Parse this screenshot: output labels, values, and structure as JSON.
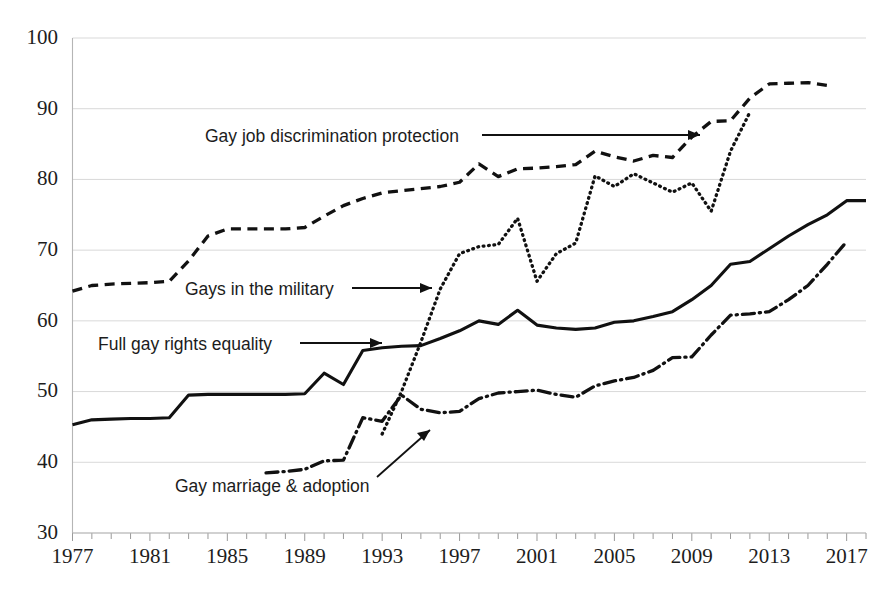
{
  "chart_data": {
    "type": "line",
    "title": "",
    "subtitle": "",
    "xlabel": "",
    "ylabel": "",
    "xlim": [
      1977,
      2018
    ],
    "ylim": [
      30,
      100
    ],
    "yticks": [
      30,
      40,
      50,
      60,
      70,
      80,
      90,
      100
    ],
    "xticks": [
      1977,
      1981,
      1985,
      1989,
      1993,
      1997,
      2001,
      2005,
      2009,
      2013,
      2017
    ],
    "xtick_step_minor": 1,
    "grid": true,
    "legend_position": "inline-annotations",
    "series": [
      {
        "name": "Gay job discrimination protection",
        "style": "dashed",
        "color": "#111111",
        "x": [
          1977,
          1978,
          1979,
          1980,
          1981,
          1982,
          1983,
          1984,
          1985,
          1986,
          1987,
          1988,
          1989,
          1990,
          1991,
          1992,
          1993,
          1994,
          1995,
          1996,
          1997,
          1998,
          1999,
          2000,
          2001,
          2002,
          2003,
          2004,
          2005,
          2006,
          2007,
          2008,
          2009,
          2010,
          2011,
          2012,
          2013,
          2014,
          2015,
          2016
        ],
        "values": [
          64.2,
          65.0,
          65.2,
          65.3,
          65.4,
          65.6,
          68.5,
          72.0,
          73.0,
          73.0,
          73.0,
          73.0,
          73.2,
          74.8,
          76.3,
          77.3,
          78.1,
          78.4,
          78.7,
          79.0,
          79.6,
          82.2,
          80.4,
          81.5,
          81.6,
          81.8,
          82.1,
          84.0,
          83.2,
          82.6,
          83.4,
          83.1,
          86.0,
          88.2,
          88.3,
          91.5,
          93.5,
          93.6,
          93.7,
          93.3
        ]
      },
      {
        "name": "Gays in the military",
        "style": "dotted",
        "color": "#111111",
        "x": [
          1993,
          1994,
          1995,
          1996,
          1997,
          1998,
          1999,
          2000,
          2001,
          2002,
          2003,
          2004,
          2005,
          2006,
          2007,
          2008,
          2009,
          2010,
          2011,
          2012
        ],
        "values": [
          44.0,
          50.0,
          57.0,
          64.5,
          69.5,
          70.5,
          70.8,
          74.5,
          65.6,
          69.5,
          71.0,
          80.5,
          79.0,
          80.8,
          79.5,
          78.2,
          79.5,
          75.5,
          84.0,
          89.5
        ]
      },
      {
        "name": "Full gay rights equality",
        "style": "solid",
        "color": "#111111",
        "x": [
          1977,
          1978,
          1979,
          1980,
          1981,
          1982,
          1983,
          1984,
          1985,
          1986,
          1987,
          1988,
          1989,
          1990,
          1991,
          1992,
          1993,
          1994,
          1995,
          1996,
          1997,
          1998,
          1999,
          2000,
          2001,
          2002,
          2003,
          2004,
          2005,
          2006,
          2007,
          2008,
          2009,
          2010,
          2011,
          2012,
          2013,
          2014,
          2015,
          2016,
          2017,
          2018
        ],
        "values": [
          45.3,
          46.0,
          46.1,
          46.2,
          46.2,
          46.3,
          49.5,
          49.6,
          49.6,
          49.6,
          49.6,
          49.6,
          49.7,
          52.6,
          51.0,
          55.8,
          56.2,
          56.4,
          56.5,
          57.5,
          58.6,
          60.0,
          59.5,
          61.5,
          59.4,
          59.0,
          58.8,
          59.0,
          59.8,
          60.0,
          60.6,
          61.3,
          63.0,
          65.0,
          68.0,
          68.4,
          70.2,
          72.0,
          73.6,
          75.0,
          77.0,
          77.0
        ]
      },
      {
        "name": "Gay marriage & adoption",
        "style": "dashdot",
        "color": "#111111",
        "x": [
          1987,
          1988,
          1989,
          1990,
          1991,
          1992,
          1993,
          1994,
          1995,
          1996,
          1997,
          1998,
          1999,
          2000,
          2001,
          2002,
          2003,
          2004,
          2005,
          2006,
          2007,
          2008,
          2009,
          2010,
          2011,
          2012,
          2013,
          2014,
          2015,
          2016,
          2017
        ],
        "values": [
          38.5,
          38.7,
          39.0,
          40.2,
          40.3,
          46.3,
          45.8,
          49.5,
          47.5,
          47.0,
          47.2,
          49.0,
          49.8,
          50.0,
          50.2,
          49.6,
          49.2,
          50.8,
          51.5,
          52.0,
          53.0,
          54.8,
          54.9,
          58.0,
          60.8,
          61.0,
          61.3,
          63.0,
          65.0,
          68.0,
          71.2
        ]
      }
    ],
    "annotations": [
      {
        "name": "gay-job-discrimination-protection",
        "label": "Gay job discrimination protection",
        "arrow": "right"
      },
      {
        "name": "gays-in-the-military",
        "label": "Gays in the military",
        "arrow": "right"
      },
      {
        "name": "full-gay-rights-equality",
        "label": "Full gay rights equality",
        "arrow": "right"
      },
      {
        "name": "gay-marriage-and-adoption",
        "label": "Gay marriage & adoption",
        "arrow": "up-right"
      }
    ]
  }
}
